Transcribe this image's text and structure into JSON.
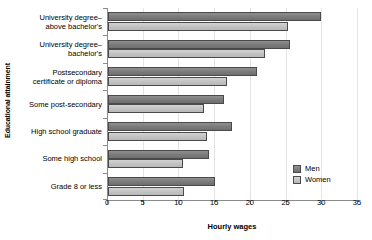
{
  "chart_data": {
    "type": "bar",
    "orientation": "horizontal",
    "title": "",
    "xlabel": "Hourly wages",
    "ylabel": "Educational attainment",
    "xlim": [
      0,
      35
    ],
    "xticks": [
      0,
      5,
      10,
      15,
      20,
      25,
      30,
      35
    ],
    "xtick_labels": [
      "0",
      "5",
      "10",
      "15",
      "20",
      "25",
      "30",
      "35"
    ],
    "grid": "vertical",
    "legend_position": "lower-right",
    "categories": [
      "University degree–above bachelor's",
      "University degree–bachelor's",
      "Postsecondary certificate or diploma",
      "Some post-secondary",
      "High school graduate",
      "Some high school",
      "Grade 8 or less"
    ],
    "category_lines": [
      [
        "University degree–",
        "above bachelor's"
      ],
      [
        "University degree–",
        "bachelor's"
      ],
      [
        "Postsecondary",
        "certificate or diploma"
      ],
      [
        "Some post-secondary",
        ""
      ],
      [
        "High school graduate",
        ""
      ],
      [
        "Some high school",
        ""
      ],
      [
        "Grade 8 or less",
        ""
      ]
    ],
    "series": [
      {
        "name": "Men",
        "color": "#7a7a7a",
        "values": [
          29.8,
          25.5,
          20.8,
          16.3,
          17.3,
          14.1,
          15.0
        ]
      },
      {
        "name": "Women",
        "color": "#c2c2c2",
        "values": [
          25.2,
          22.0,
          16.7,
          13.4,
          13.8,
          10.5,
          10.7
        ]
      }
    ]
  },
  "legend": {
    "entries": [
      {
        "label": "Men"
      },
      {
        "label": "Women"
      }
    ]
  },
  "colors": {
    "men": "#7a7a7a",
    "women": "#c2c2c2",
    "axis": "#8a8a8a",
    "grid": "#e4e4e4",
    "text": "#000000",
    "background": "#ffffff"
  }
}
